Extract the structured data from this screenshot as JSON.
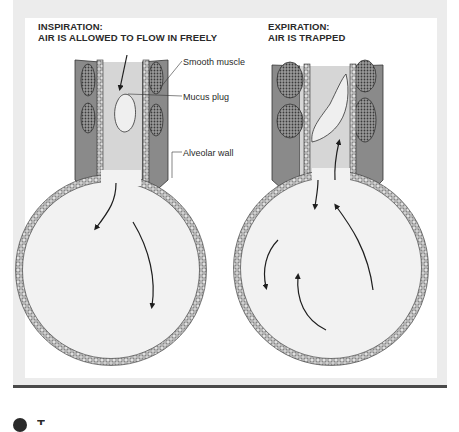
{
  "figure": {
    "panels": [
      {
        "id": "inspiration",
        "title_line1": "INSPIRATION:",
        "title_line2": "AIR IS ALLOWED TO FLOW IN FREELY"
      },
      {
        "id": "expiration",
        "title_line1": "EXPIRATION:",
        "title_line2": "AIR IS TRAPPED"
      }
    ],
    "labels": {
      "smooth_muscle": "Smooth muscle",
      "mucus_plug": "Mucus plug",
      "alveolar_wall": "Alveolar wall"
    },
    "colors": {
      "frame": "#ececec",
      "rule": "#4a4a4a",
      "muscle": "#8a8a8a",
      "airway_fill": "#d6d6d6",
      "alveolus_fill": "#f2f2f2",
      "ink": "#2a2a2a"
    }
  },
  "footer": {
    "bullet_icon": "filled-circle",
    "text": "T"
  }
}
